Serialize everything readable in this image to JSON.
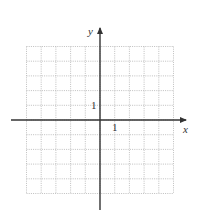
{
  "figure": {
    "type": "coordinate-grid",
    "x_axis_label": "x",
    "y_axis_label": "y",
    "x_tick_label": "1",
    "y_tick_label": "1",
    "x_range": [
      -5,
      5
    ],
    "y_range": [
      -5,
      5
    ],
    "grid_step": 1,
    "grid_style": "dotted",
    "colors": {
      "axis": "#333333",
      "grid": "#b8b8b8",
      "background": "#ffffff"
    }
  }
}
